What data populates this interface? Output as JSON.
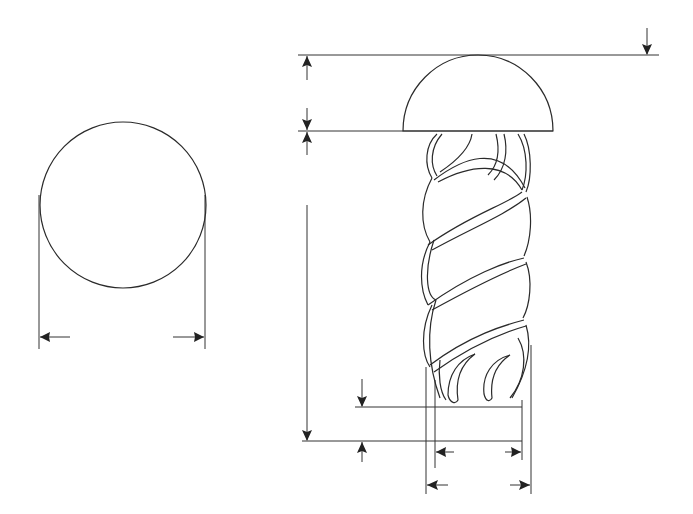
{
  "diagram": {
    "title": "Rivet with round head and twisted shank - dimension drawing",
    "views": [
      {
        "name": "end-view",
        "shape": "circle",
        "dimension": "diameter (horizontal, arrows pointing outward)"
      },
      {
        "name": "side-view",
        "parts": [
          "hemispherical head",
          "twisted fluted shank"
        ],
        "dimensions": [
          "head height (vertical)",
          "shank length (vertical)",
          "tail offset (vertical)",
          "inner diameter (horizontal)",
          "outer diameter (horizontal)"
        ]
      }
    ],
    "colors": {
      "line": "#2a2a2a",
      "background": "#ffffff"
    }
  }
}
